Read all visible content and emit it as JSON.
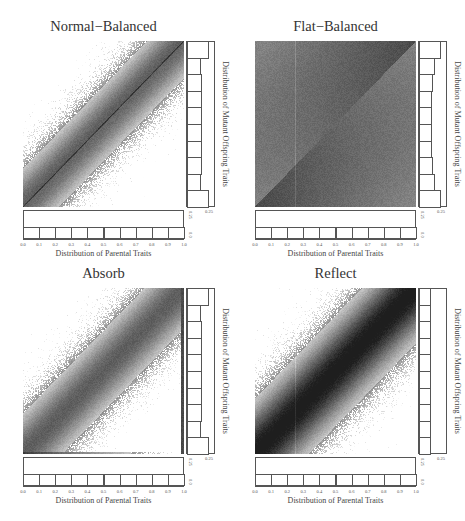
{
  "figure": {
    "panels": [
      {
        "id": "normal-balanced",
        "title": "Normal−Balanced",
        "xlabel": "Distribution of Parental Traits",
        "ylabel": "Distribution of Mutant Offspring Traits",
        "right_axis_tick": "0.25",
        "bottom_axis_ticks": [
          "0.25",
          "0.0"
        ],
        "x_ticks": [
          "0.0",
          "0.1",
          "0.2",
          "0.3",
          "0.4",
          "0.5",
          "0.6",
          "0.7",
          "0.8",
          "0.9",
          "1.0"
        ],
        "density_mode": "normal",
        "offspring_hist": [
          0.19,
          0.12,
          0.13,
          0.13,
          0.13,
          0.13,
          0.13,
          0.13,
          0.12,
          0.19
        ],
        "parent_hist": [
          0.1,
          0.1,
          0.1,
          0.1,
          0.1,
          0.1,
          0.1,
          0.1,
          0.1,
          0.1
        ]
      },
      {
        "id": "flat-balanced",
        "title": "Flat−Balanced",
        "xlabel": "Distribution of Parental Traits",
        "ylabel": "Distribution of Mutant Offspring Traits",
        "right_axis_tick": "0.25",
        "bottom_axis_ticks": [
          "0.25",
          "0.0"
        ],
        "x_ticks": [
          "0.0",
          "0.1",
          "0.2",
          "0.3",
          "0.4",
          "0.5",
          "0.6",
          "0.7",
          "0.8",
          "0.9",
          "1.0"
        ],
        "density_mode": "flat",
        "offspring_hist": [
          0.19,
          0.14,
          0.12,
          0.11,
          0.11,
          0.11,
          0.11,
          0.12,
          0.14,
          0.19
        ],
        "parent_hist": [
          0.1,
          0.1,
          0.1,
          0.1,
          0.1,
          0.1,
          0.1,
          0.1,
          0.1,
          0.1
        ]
      },
      {
        "id": "absorb",
        "title": "Absorb",
        "xlabel": "Distribution of Parental Traits",
        "ylabel": "Distribution of Mutant Offspring Traits",
        "right_axis_tick": "0.25",
        "bottom_axis_ticks": [
          "0.25",
          "0.0"
        ],
        "x_ticks": [
          "0.0",
          "0.1",
          "0.2",
          "0.3",
          "0.4",
          "0.5",
          "0.6",
          "0.7",
          "0.8",
          "0.9",
          "1.0"
        ],
        "density_mode": "absorb",
        "offspring_hist": [
          0.19,
          0.12,
          0.13,
          0.13,
          0.13,
          0.13,
          0.13,
          0.13,
          0.12,
          0.19
        ],
        "parent_hist": [
          0.1,
          0.1,
          0.1,
          0.1,
          0.1,
          0.1,
          0.1,
          0.1,
          0.1,
          0.1
        ]
      },
      {
        "id": "reflect",
        "title": "Reflect",
        "xlabel": "Distribution of Parental Traits",
        "ylabel": "Distribution of Mutant Offspring Traits",
        "right_axis_tick": "0.25",
        "bottom_axis_ticks": [
          "0.25",
          "0.0"
        ],
        "x_ticks": [
          "0.0",
          "0.1",
          "0.2",
          "0.3",
          "0.4",
          "0.5",
          "0.6",
          "0.7",
          "0.8",
          "0.9",
          "1.0"
        ],
        "density_mode": "reflect",
        "offspring_hist": [
          0.1,
          0.1,
          0.1,
          0.1,
          0.1,
          0.1,
          0.1,
          0.1,
          0.1,
          0.1
        ],
        "parent_hist": [
          0.1,
          0.1,
          0.1,
          0.1,
          0.1,
          0.1,
          0.1,
          0.1,
          0.1,
          0.1
        ]
      }
    ]
  },
  "chart_data": [
    {
      "type": "heatmap",
      "title": "Normal−Balanced",
      "xlabel": "Distribution of Parental Traits",
      "ylabel": "Distribution of Mutant Offspring Traits",
      "xlim": [
        0.0,
        1.0
      ],
      "ylim": [
        0.0,
        1.0
      ],
      "x_ticks": [
        0.0,
        0.1,
        0.2,
        0.3,
        0.4,
        0.5,
        0.6,
        0.7,
        0.8,
        0.9,
        1.0
      ],
      "description": "Density of offspring vs parent traits concentrated along the diagonal band; darker diagonal line y=x; lighter away from diagonal",
      "marginal_x": {
        "type": "bar",
        "bins": 10,
        "values": [
          0.1,
          0.1,
          0.1,
          0.1,
          0.1,
          0.1,
          0.1,
          0.1,
          0.1,
          0.1
        ],
        "axis_max": 0.25
      },
      "marginal_y": {
        "type": "bar",
        "bins": 10,
        "values": [
          0.19,
          0.12,
          0.13,
          0.13,
          0.13,
          0.13,
          0.13,
          0.13,
          0.12,
          0.19
        ],
        "axis_max": 0.25
      }
    },
    {
      "type": "heatmap",
      "title": "Flat−Balanced",
      "xlabel": "Distribution of Parental Traits",
      "ylabel": "Distribution of Mutant Offspring Traits",
      "xlim": [
        0.0,
        1.0
      ],
      "ylim": [
        0.0,
        1.0
      ],
      "x_ticks": [
        0.0,
        0.1,
        0.2,
        0.3,
        0.4,
        0.5,
        0.6,
        0.7,
        0.8,
        0.9,
        1.0
      ],
      "description": "Uniform grey density with darker gradient toward the diagonal from upper-left triangle and lower-left corner",
      "marginal_x": {
        "type": "bar",
        "bins": 10,
        "values": [
          0.1,
          0.1,
          0.1,
          0.1,
          0.1,
          0.1,
          0.1,
          0.1,
          0.1,
          0.1
        ],
        "axis_max": 0.25
      },
      "marginal_y": {
        "type": "bar",
        "bins": 10,
        "values": [
          0.19,
          0.14,
          0.12,
          0.11,
          0.11,
          0.11,
          0.11,
          0.12,
          0.14,
          0.19
        ],
        "axis_max": 0.25
      }
    },
    {
      "type": "heatmap",
      "title": "Absorb",
      "xlabel": "Distribution of Parental Traits",
      "ylabel": "Distribution of Mutant Offspring Traits",
      "xlim": [
        0.0,
        1.0
      ],
      "ylim": [
        0.0,
        1.0
      ],
      "x_ticks": [
        0.0,
        0.1,
        0.2,
        0.3,
        0.4,
        0.5,
        0.6,
        0.7,
        0.8,
        0.9,
        1.0
      ],
      "description": "Diagonal band density with mass accumulated at the boundaries (dark bottom and right edges)",
      "marginal_x": {
        "type": "bar",
        "bins": 10,
        "values": [
          0.1,
          0.1,
          0.1,
          0.1,
          0.1,
          0.1,
          0.1,
          0.1,
          0.1,
          0.1
        ],
        "axis_max": 0.25
      },
      "marginal_y": {
        "type": "bar",
        "bins": 10,
        "values": [
          0.19,
          0.12,
          0.13,
          0.13,
          0.13,
          0.13,
          0.13,
          0.13,
          0.12,
          0.19
        ],
        "axis_max": 0.25
      }
    },
    {
      "type": "heatmap",
      "title": "Reflect",
      "xlabel": "Distribution of Parental Traits",
      "ylabel": "Distribution of Mutant Offspring Traits",
      "xlim": [
        0.0,
        1.0
      ],
      "ylim": [
        0.0,
        1.0
      ],
      "x_ticks": [
        0.0,
        0.1,
        0.2,
        0.3,
        0.4,
        0.5,
        0.6,
        0.7,
        0.8,
        0.9,
        1.0
      ],
      "description": "Broad dark diagonal band, darkest near corners due to reflection at boundaries",
      "marginal_x": {
        "type": "bar",
        "bins": 10,
        "values": [
          0.1,
          0.1,
          0.1,
          0.1,
          0.1,
          0.1,
          0.1,
          0.1,
          0.1,
          0.1
        ],
        "axis_max": 0.25
      },
      "marginal_y": {
        "type": "bar",
        "bins": 10,
        "values": [
          0.1,
          0.1,
          0.1,
          0.1,
          0.1,
          0.1,
          0.1,
          0.1,
          0.1,
          0.1
        ],
        "axis_max": 0.25
      }
    }
  ]
}
